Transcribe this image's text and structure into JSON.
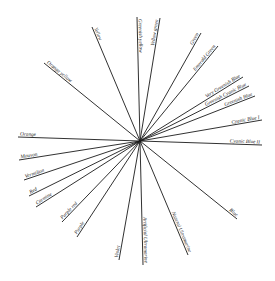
{
  "diagram": {
    "center": [
      140,
      141
    ],
    "rays": [
      {
        "label": "Yellow",
        "end": [
          92,
          27
        ]
      },
      {
        "label": "Greenish yellow",
        "end": [
          137,
          17
        ]
      },
      {
        "label": "Yellow green",
        "end": [
          160,
          18
        ]
      },
      {
        "label": "Green",
        "end": [
          201,
          33
        ]
      },
      {
        "label": "Emerald Green",
        "end": [
          218,
          46
        ]
      },
      {
        "label": "Very Greenish Blue",
        "end": [
          243,
          77
        ]
      },
      {
        "label": "Greenish Cyanic Blue",
        "end": [
          249,
          86
        ]
      },
      {
        "label": "Greenish Blue",
        "end": [
          255,
          96
        ]
      },
      {
        "label": "Cyanic Blue I",
        "end": [
          262,
          120
        ]
      },
      {
        "label": "Cyanic Blue II",
        "end": [
          262,
          145
        ]
      },
      {
        "label": "Blue",
        "end": [
          237,
          219
        ]
      },
      {
        "label": "Natural Ultramarine",
        "end": [
          188,
          255
        ]
      },
      {
        "label": "Artificial Ultramarine",
        "end": [
          143,
          265
        ]
      },
      {
        "label": "Violet",
        "end": [
          119,
          260
        ]
      },
      {
        "label": "Purple",
        "end": [
          77,
          237
        ]
      },
      {
        "label": "Purple red",
        "end": [
          62,
          222
        ]
      },
      {
        "label": "Carmine",
        "end": [
          36,
          207
        ]
      },
      {
        "label": "Red",
        "end": [
          29,
          196
        ]
      },
      {
        "label": "Vermilion",
        "end": [
          24,
          180
        ]
      },
      {
        "label": "Mouvon",
        "end": [
          19,
          160
        ]
      },
      {
        "label": "Orange",
        "end": [
          18,
          137
        ]
      },
      {
        "label": "Orange yellow",
        "end": [
          44,
          63
        ]
      }
    ]
  }
}
